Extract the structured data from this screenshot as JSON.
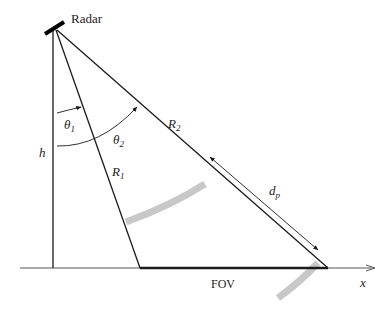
{
  "labels": {
    "radar": "Radar",
    "h": "h",
    "theta1": "θ",
    "theta1_sub": "1",
    "theta2": "θ",
    "theta2_sub": "2",
    "r1": "R",
    "r1_sub": "1",
    "r2": "R",
    "r2_sub": "2",
    "dp": "d",
    "dp_sub": "p",
    "fov": "FOV",
    "x_axis": "x"
  },
  "colors": {
    "line": "#1a1a1a",
    "arc_band": "#c8c8c8",
    "axis": "#555555"
  }
}
